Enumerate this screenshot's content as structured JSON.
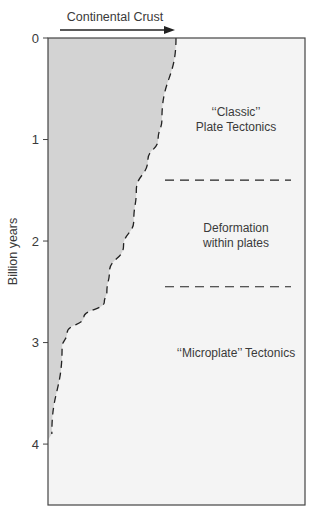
{
  "chart_data": {
    "type": "area",
    "title": "Continental Crust",
    "title_arrow": "right",
    "xlabel": "Continental Crust",
    "ylabel": "Billion years",
    "y_ticks": [
      "0",
      "1",
      "2",
      "3",
      "4"
    ],
    "ylim": [
      0,
      4.6
    ],
    "y_inverted": true,
    "grid": false,
    "crust_boundary": {
      "description": "Relative amount of continental crust (fraction of present-day extent) vs. time before present",
      "points": [
        {
          "age": 0.0,
          "fraction": 1.0
        },
        {
          "age": 0.8,
          "fraction": 0.89
        },
        {
          "age": 1.0,
          "fraction": 0.86
        },
        {
          "age": 1.2,
          "fraction": 0.78
        },
        {
          "age": 1.5,
          "fraction": 0.69
        },
        {
          "age": 1.8,
          "fraction": 0.67
        },
        {
          "age": 2.05,
          "fraction": 0.59
        },
        {
          "age": 2.3,
          "fraction": 0.48
        },
        {
          "age": 2.5,
          "fraction": 0.46
        },
        {
          "age": 2.6,
          "fraction": 0.44
        },
        {
          "age": 2.75,
          "fraction": 0.28
        },
        {
          "age": 2.9,
          "fraction": 0.15
        },
        {
          "age": 3.05,
          "fraction": 0.11
        },
        {
          "age": 3.9,
          "fraction": 0.03
        }
      ]
    },
    "regime_boundaries": [
      1.4,
      2.45
    ],
    "annotations": [
      {
        "id": "classic",
        "lines": [
          "‘‘Classic’’",
          "Plate Tectonics"
        ],
        "age": 0.8
      },
      {
        "id": "deformation",
        "lines": [
          "Deformation",
          "within plates"
        ],
        "age": 1.95
      },
      {
        "id": "microplate",
        "lines": [
          "‘‘Microplate’’ Tectonics"
        ],
        "age": 3.1
      }
    ],
    "colors": {
      "crust_fill": "#d3d3d3",
      "background": "#f4f4f4",
      "frame": "#444444",
      "dash": "#222222"
    }
  }
}
